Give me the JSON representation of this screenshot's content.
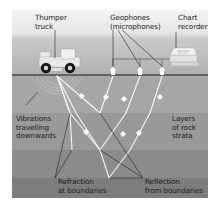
{
  "diagram": {
    "labels": {
      "thumper_truck": "Thumper\ntruck",
      "geophones": "Geophones\n(microphones)",
      "chart_recorder": "Chart\nrecorder",
      "vibrations": "Vibrations\ntravelling\ndownwards",
      "layers": "Layers\nof rock\nstrata",
      "refraction": "Refraction\nat boundaries",
      "reflection": "Reflection\nfrom boundaries"
    },
    "colors": {
      "background": "#ffffff",
      "sky_top": "#f2f2f2",
      "sky_bottom": "#b4b4b4",
      "ground_line": "#444444",
      "stratum_1": "#a9a9a9",
      "stratum_2": "#9a9a9a",
      "stratum_3": "#8c8c8c",
      "stratum_4": "#7e7e7e",
      "ray": "#f4f4f4",
      "leader": "#111111"
    },
    "icons": [
      "thumper-truck-icon",
      "geophone-icon",
      "chart-recorder-icon",
      "vibration-wave-icon"
    ]
  }
}
